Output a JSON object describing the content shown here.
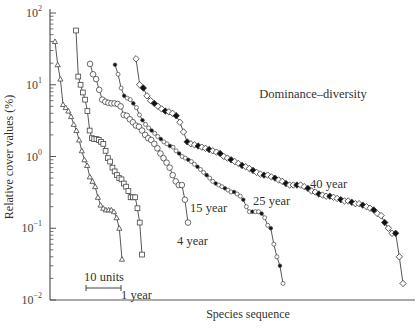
{
  "chart_data": {
    "type": "line",
    "title": "Dominance–diversity",
    "xlabel": "Species sequence",
    "ylabel": "Relative cover values (%)",
    "yscale": "log",
    "ylim": [
      0.01,
      100
    ],
    "y_ticks": [
      {
        "value": 100,
        "base": "10",
        "exp": "2"
      },
      {
        "value": 10,
        "base": "10",
        "exp": "1"
      },
      {
        "value": 1,
        "base": "10",
        "exp": "0"
      },
      {
        "value": 0.1,
        "base": "10",
        "exp": "−1"
      },
      {
        "value": 0.01,
        "base": "10",
        "exp": "−2"
      }
    ],
    "x_ticks": [],
    "grid": false,
    "legend": "none (curves labeled inline)",
    "scale_bar": {
      "label": "10 units",
      "length_species": 10
    },
    "series": [
      {
        "name": "1 year",
        "marker": "triangle-open",
        "label_pos": [
          122,
          296
        ],
        "x": [
          0,
          1,
          2,
          3,
          4,
          5,
          6,
          7,
          8,
          9,
          10,
          11,
          12,
          13,
          14,
          15,
          16,
          17,
          18,
          19,
          20,
          21,
          22,
          23,
          24,
          25
        ],
        "y": [
          40,
          19,
          12,
          5.3,
          4.8,
          4.3,
          3.6,
          2.8,
          2.3,
          1.7,
          1.2,
          0.9,
          0.75,
          0.52,
          0.45,
          0.38,
          0.27,
          0.21,
          0.19,
          0.18,
          0.18,
          0.18,
          0.17,
          0.14,
          0.1,
          0.037
        ]
      },
      {
        "name": "4 year",
        "marker": "square-open",
        "label_pos": [
          127,
          275
        ],
        "x": [
          0,
          1,
          2,
          3,
          4,
          5,
          6,
          7,
          8,
          9,
          10,
          11,
          12,
          13,
          14,
          15,
          16,
          17,
          18,
          19,
          20,
          21,
          22,
          23,
          24,
          25,
          26,
          27,
          28,
          29
        ],
        "y": [
          57,
          13,
          10,
          7.8,
          6.2,
          4.3,
          2.3,
          1.8,
          1.75,
          1.75,
          1.7,
          1.6,
          1.5,
          1.2,
          0.95,
          0.85,
          0.7,
          0.62,
          0.55,
          0.5,
          0.48,
          0.42,
          0.38,
          0.33,
          0.27,
          0.27,
          0.27,
          0.19,
          0.12,
          0.043
        ]
      },
      {
        "name": "15 year",
        "marker": "circle-open",
        "label_pos": [
          190,
          244
        ],
        "x": [
          0,
          1,
          2,
          3,
          4,
          5,
          6,
          7,
          8,
          9,
          10,
          11,
          12,
          13,
          14,
          15,
          16,
          17,
          18,
          19,
          20,
          21,
          22,
          23,
          24,
          25,
          26,
          27,
          28,
          29,
          30,
          31,
          32
        ],
        "y": [
          19.5,
          14,
          12,
          8.5,
          6.2,
          5.8,
          5.6,
          5.5,
          5.5,
          5.4,
          5,
          3.8,
          3.7,
          3.3,
          3.0,
          2.7,
          2.6,
          2.3,
          2.0,
          1.8,
          1.7,
          1.5,
          1.3,
          1.1,
          0.95,
          0.82,
          0.7,
          0.55,
          0.45,
          0.4,
          0.4,
          0.25,
          0.12
        ]
      },
      {
        "name": "25 year",
        "marker": "circle-small-mixed",
        "label_pos": [
          252,
          219
        ],
        "x": [
          0,
          1,
          2,
          3,
          4,
          5,
          6,
          7,
          8,
          9,
          10,
          11,
          12,
          13,
          14,
          15,
          16,
          17,
          18,
          19,
          20,
          21,
          22,
          23,
          24,
          25,
          26,
          27,
          28,
          29,
          30,
          31,
          32,
          33,
          34,
          35,
          36,
          37,
          38,
          39,
          40,
          41,
          42,
          43,
          44,
          45,
          46,
          47,
          48,
          49,
          50,
          51,
          52,
          53,
          54,
          55
        ],
        "y": [
          19,
          14,
          9,
          7,
          6.5,
          6.2,
          5.5,
          4.8,
          3.8,
          3.2,
          2.8,
          2.5,
          2.3,
          2.1,
          1.9,
          1.75,
          1.6,
          1.5,
          1.4,
          1.35,
          1.2,
          1.1,
          1.0,
          0.95,
          0.9,
          0.85,
          0.78,
          0.72,
          0.66,
          0.6,
          0.55,
          0.5,
          0.45,
          0.42,
          0.4,
          0.38,
          0.36,
          0.34,
          0.32,
          0.32,
          0.3,
          0.28,
          0.25,
          0.2,
          0.17,
          0.17,
          0.17,
          0.17,
          0.16,
          0.14,
          0.11,
          0.1,
          0.06,
          0.04,
          0.03,
          0.017
        ]
      },
      {
        "name": "40 year",
        "marker": "diamond-mixed",
        "label_pos": [
          308,
          219
        ],
        "x": [
          0,
          1,
          2,
          3,
          4,
          5,
          6,
          7,
          8,
          9,
          10,
          11,
          12,
          13,
          14,
          15,
          16,
          17,
          18,
          19,
          20,
          21,
          22,
          23,
          24,
          25,
          26,
          27,
          28,
          29,
          30,
          31,
          32,
          33,
          34,
          35,
          36,
          37,
          38,
          39,
          40,
          41,
          42,
          43,
          44,
          45,
          46,
          47,
          48,
          49,
          50,
          51,
          52,
          53,
          54,
          55,
          56,
          57,
          58,
          59,
          60,
          61,
          62,
          63,
          64,
          65,
          66,
          67,
          68,
          69,
          70,
          71,
          72,
          73
        ],
        "y": [
          23,
          10,
          9,
          7,
          6,
          5.5,
          5,
          4.6,
          4.3,
          4.2,
          4.0,
          3.7,
          3.0,
          2.2,
          1.6,
          1.5,
          1.45,
          1.4,
          1.35,
          1.3,
          1.25,
          1.2,
          1.15,
          1.1,
          1.0,
          0.95,
          0.9,
          0.85,
          0.8,
          0.75,
          0.72,
          0.68,
          0.64,
          0.6,
          0.57,
          0.55,
          0.55,
          0.52,
          0.5,
          0.47,
          0.45,
          0.42,
          0.4,
          0.4,
          0.4,
          0.4,
          0.38,
          0.36,
          0.33,
          0.32,
          0.3,
          0.29,
          0.28,
          0.28,
          0.27,
          0.26,
          0.25,
          0.24,
          0.24,
          0.23,
          0.22,
          0.22,
          0.21,
          0.2,
          0.19,
          0.18,
          0.16,
          0.15,
          0.12,
          0.1,
          0.085,
          0.085,
          0.04,
          0.017
        ]
      }
    ]
  }
}
